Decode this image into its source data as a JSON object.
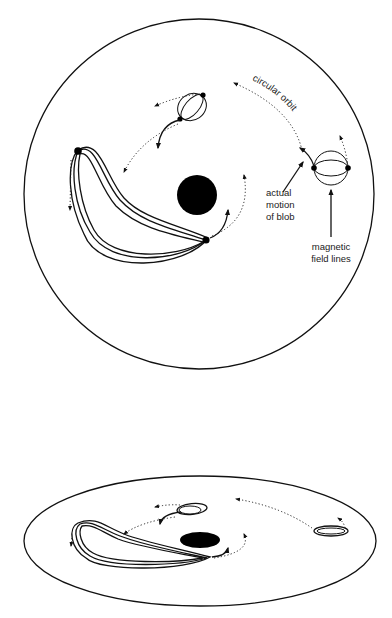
{
  "figure": {
    "top_view": {
      "labels": {
        "circular_orbit": "circular orbit",
        "actual_motion_line1": "actual",
        "actual_motion_line2": "motion",
        "actual_motion_line3": "of blob",
        "magnetic_line1": "magnetic",
        "magnetic_line2": "field lines"
      }
    },
    "perspective_view": {
      "labels": {}
    },
    "colors": {
      "ink": "#111111",
      "background": "#ffffff"
    }
  }
}
